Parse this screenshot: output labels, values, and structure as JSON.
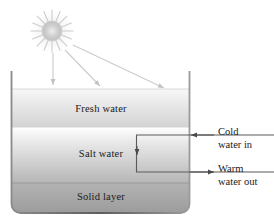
{
  "figure": {
    "colors": {
      "outline": "#6f6f6f",
      "text": "#1a1a1a",
      "ray": "#c9c9c9",
      "pipe": "#5a5a5a",
      "fresh_water_top": "#f4f4f4",
      "fresh_water_bottom": "#d9d9d9",
      "salt_water_top": "#fdfdfd",
      "salt_water_bottom": "#b8b8b8",
      "solid_layer_top": "#b0b0b0",
      "solid_layer_bottom": "#9a9a9a",
      "sun_core": "#d6d6d6",
      "sun_glow": "#ffffff"
    },
    "sun": {
      "icon": "sun-icon",
      "center_x": 52,
      "center_y": 31,
      "core_radius": 10,
      "ray_count": 16,
      "ray_length": 19
    },
    "sun_rays": [
      {
        "name": "sun-ray-1",
        "x1": 53,
        "y1": 52,
        "x2": 53,
        "y2": 86
      },
      {
        "name": "sun-ray-2",
        "x1": 64,
        "y1": 51,
        "x2": 101,
        "y2": 88
      },
      {
        "name": "sun-ray-3",
        "x1": 72,
        "y1": 46,
        "x2": 166,
        "y2": 89
      }
    ],
    "container": {
      "left": 11,
      "right": 190,
      "top": 72,
      "bottom": 213,
      "corner_radius": 9
    },
    "layers": [
      {
        "id": "fresh-water",
        "label": "Fresh water",
        "top": 89,
        "bottom": 128,
        "label_y": 104
      },
      {
        "id": "salt-water",
        "label": "Salt water",
        "top": 128,
        "bottom": 183,
        "label_y": 149
      },
      {
        "id": "solid-layer",
        "label": "Solid layer",
        "top": 183,
        "bottom": 213,
        "label_y": 192
      }
    ],
    "pipe": {
      "name": "heat-exchanger-pipe",
      "left_x": 136,
      "top_y": 135,
      "bottom_y": 172,
      "right_edge_x": 274,
      "flow_arrow_x": 138,
      "flow_arrow_y": 155
    },
    "annotations": [
      {
        "id": "cold-water-in",
        "line1": "Cold",
        "line2": "water in",
        "arrow_direction": "left",
        "arrow_from_x": 212,
        "arrow_to_x": 190,
        "arrow_y": 135,
        "label_x": 218,
        "label_y": 127
      },
      {
        "id": "warm-water-out",
        "line1": "Warm",
        "line2": "water out",
        "arrow_direction": "right",
        "arrow_from_x": 190,
        "arrow_to_x": 214,
        "arrow_y": 172,
        "label_x": 218,
        "label_y": 164
      }
    ]
  }
}
